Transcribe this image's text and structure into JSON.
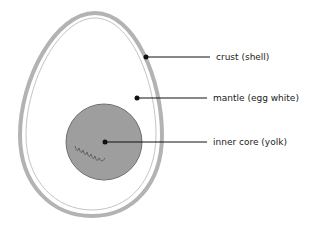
{
  "diagram": {
    "labels": [
      {
        "id": "crust",
        "text": "crust (shell)"
      },
      {
        "id": "mantle",
        "text": "mantle (egg white)"
      },
      {
        "id": "core",
        "text": "inner core (yolk)"
      }
    ],
    "colors": {
      "shell": "#b3b3b3",
      "yolk": "#9e9e9e",
      "yolk_outline": "#6e6e6e",
      "line": "#111111"
    }
  }
}
